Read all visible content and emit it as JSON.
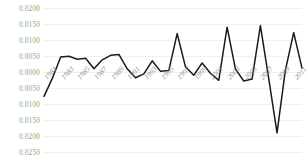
{
  "chart_data": {
    "type": "line",
    "title": "",
    "subtitle": "",
    "xlabel": "",
    "ylabel": "",
    "grid": true,
    "legend": false,
    "legend_position": "none",
    "line_color": "#1a1a1a",
    "grid_color": "#f0f0f0",
    "tick_label_color": "#9a9a9a",
    "ylim": [
      -0.025,
      0.02
    ],
    "ytick_values": [
      0.02,
      0.015,
      0.01,
      0.005,
      0.0,
      -0.005,
      -0.01,
      -0.015,
      -0.02,
      -0.025
    ],
    "ytick_labels": [
      "0.0200",
      "0.0150",
      "0.0100",
      "0.0050",
      "0.0000",
      "0.0050",
      "0.0100",
      "0.0150",
      "0.0200",
      "0.0250"
    ],
    "xtick_labels": [
      "1981",
      "1983",
      "1985",
      "1987",
      "1989",
      "1991",
      "1993",
      "1995",
      "1997",
      "1999",
      "2001",
      "2003",
      "2005",
      "2007",
      "2009",
      "2011"
    ],
    "x": [
      1981,
      1982,
      1983,
      1984,
      1985,
      1986,
      1987,
      1988,
      1989,
      1990,
      1991,
      1992,
      1993,
      1994,
      1995,
      1996,
      1997,
      1998,
      1999,
      2000,
      2001,
      2002,
      2003,
      2004,
      2005,
      2006,
      2007,
      2008,
      2009,
      2010,
      2011,
      2012
    ],
    "series": [
      {
        "name": "value",
        "values": [
          -0.0076,
          -0.002,
          0.0047,
          0.0049,
          0.004,
          0.0043,
          0.001,
          0.0038,
          0.0052,
          0.0055,
          0.001,
          -0.0018,
          -0.0006,
          0.0035,
          0.0002,
          0.0005,
          0.012,
          0.0016,
          -0.001,
          0.0028,
          -0.0004,
          -0.0026,
          0.014,
          0.001,
          -0.0028,
          -0.0022,
          0.0145,
          -0.002,
          -0.019,
          0.0005,
          0.0123,
          0.0012
        ]
      }
    ]
  }
}
